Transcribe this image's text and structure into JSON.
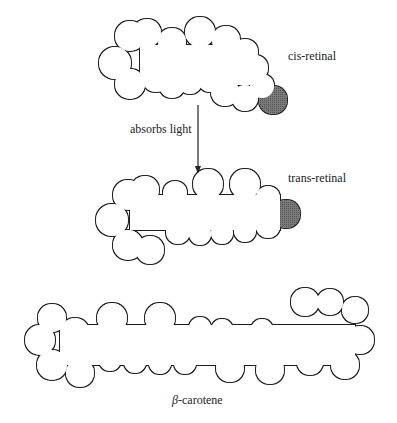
{
  "diagram": {
    "molecules": [
      {
        "id": "cis-retinal",
        "label": "cis-retinal"
      },
      {
        "id": "trans-retinal",
        "label": "trans-retinal"
      },
      {
        "id": "beta-carotene",
        "label_prefix": "β",
        "label_suffix": "-carotene"
      }
    ],
    "arrow": {
      "label": "absorbs light",
      "from": "cis-retinal",
      "to": "trans-retinal"
    },
    "colors": {
      "outline": "#1a1a1a",
      "fill": "#ffffff",
      "cap": "#6e6e6e"
    }
  }
}
